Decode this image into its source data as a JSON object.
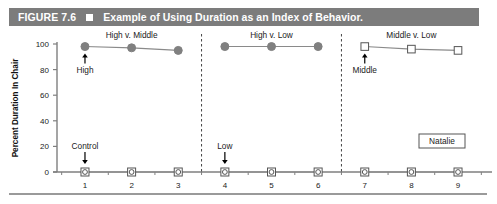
{
  "caption": {
    "figure_number": "FIGURE 7.6",
    "bullet_icon": "filled-square-icon",
    "title": "Example of Using Duration as an Index of Behavior.",
    "bar_color": "#7c7c7c",
    "text_color": "#ffffff"
  },
  "subject_box": {
    "label": "Natalie"
  },
  "chart_data": {
    "type": "line",
    "title": "Example of Using Duration as an Index of Behavior.",
    "xlabel": "",
    "ylabel": "Percent Duration In Chair",
    "x": [
      1,
      2,
      3,
      4,
      5,
      6,
      7,
      8,
      9
    ],
    "xtick_labels": [
      "1",
      "2",
      "3",
      "4",
      "5",
      "6",
      "7",
      "8",
      "9"
    ],
    "ytick_labels": [
      "0",
      "20",
      "40",
      "60",
      "80",
      "100"
    ],
    "yticks": [
      0,
      20,
      40,
      60,
      80,
      100
    ],
    "ylim": [
      0,
      100
    ],
    "xlim": [
      0.4,
      9.6
    ],
    "grid": false,
    "legend_position": "none",
    "phases": [
      {
        "name": "High v. Middle",
        "label": "High v. Middle",
        "sessions": [
          1,
          2,
          3
        ],
        "label_x": 2,
        "label_y": 107
      },
      {
        "name": "High v. Low",
        "label": "High v. Low",
        "sessions": [
          4,
          5,
          6
        ],
        "label_x": 5,
        "label_y": 107
      },
      {
        "name": "Middle v. Low",
        "label": "Middle v. Low",
        "sessions": [
          7,
          8,
          9
        ],
        "label_x": 8,
        "label_y": 107
      }
    ],
    "phase_dividers": [
      3.5,
      6.5
    ],
    "series": [
      {
        "name": "Preferred stimulus (upper)",
        "marker": "filled-circle",
        "marker_color": "#808080",
        "line_color": "#8a8a8a",
        "segments": [
          {
            "x": [
              1,
              2,
              3
            ],
            "values": [
              98,
              97,
              95
            ]
          },
          {
            "x": [
              4,
              5,
              6
            ],
            "values": [
              98,
              98,
              98
            ]
          }
        ]
      },
      {
        "name": "Preferred stimulus (upper, open)",
        "marker": "open-square",
        "marker_color": "#ffffff",
        "line_color": "#8a8a8a",
        "segments": [
          {
            "x": [
              7,
              8,
              9
            ],
            "values": [
              98,
              96,
              95
            ]
          }
        ]
      },
      {
        "name": "Non-preferred / control (lower)",
        "marker": "open-square-with-circle",
        "marker_color": "#ffffff",
        "line_color": "#8a8a8a",
        "segments": [
          {
            "x": [
              1,
              2,
              3
            ],
            "values": [
              0,
              0,
              0
            ]
          },
          {
            "x": [
              4,
              5,
              6
            ],
            "values": [
              0,
              0,
              0
            ]
          },
          {
            "x": [
              7,
              8,
              9
            ],
            "values": [
              0,
              0,
              0
            ]
          }
        ]
      }
    ],
    "annotations": [
      {
        "text": "High",
        "x": 1,
        "y": 98,
        "arrow": "up",
        "position": "below"
      },
      {
        "text": "Control",
        "x": 1,
        "y": 0,
        "arrow": "down",
        "position": "above"
      },
      {
        "text": "Low",
        "x": 4,
        "y": 0,
        "arrow": "down",
        "position": "above"
      },
      {
        "text": "Middle",
        "x": 7,
        "y": 98,
        "arrow": "up",
        "position": "below"
      }
    ]
  }
}
